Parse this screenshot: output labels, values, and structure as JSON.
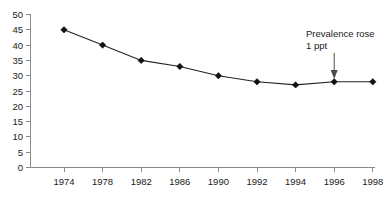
{
  "chart_data": {
    "type": "line",
    "title": "",
    "subtitle": "",
    "xlabel": "",
    "ylabel": "",
    "categories": [
      "1974",
      "1978",
      "1982",
      "1986",
      "1990",
      "1992",
      "1994",
      "1996",
      "1998"
    ],
    "values": [
      45,
      40,
      35,
      33,
      30,
      28,
      27,
      28,
      28
    ],
    "series": [
      {
        "name": "Prevalence",
        "values": [
          45,
          40,
          35,
          33,
          30,
          28,
          27,
          28,
          28
        ]
      }
    ],
    "ylim": [
      0,
      50
    ],
    "ytick_step": 5,
    "ytick_labels": [
      "50",
      "45",
      "40",
      "35",
      "30",
      "25",
      "20",
      "15",
      "10",
      "5",
      "0"
    ],
    "xtick_labels": [
      "1974",
      "1978",
      "1982",
      "1986",
      "1990",
      "1992",
      "1994",
      "1996",
      "1998"
    ],
    "grid": false,
    "legend": "none",
    "marker": "diamond",
    "line_color": "#222222",
    "marker_color": "#111111",
    "axis_color": "#8a8a8a",
    "annotations": [
      {
        "name": "prevalence-rose-note",
        "line1": "Prevalence rose",
        "line2": "1 ppt",
        "points_to_category": "1996",
        "points_to_value": 28,
        "arrow": "down"
      }
    ]
  },
  "footnote": {
    "text": ""
  }
}
